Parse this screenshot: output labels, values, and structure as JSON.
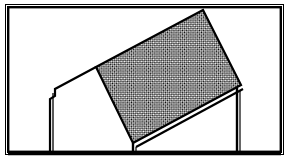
{
  "figure": {
    "type": "technical-line-drawing",
    "caption": "",
    "canvas": {
      "width": 289,
      "height": 167,
      "background": "#ffffff"
    },
    "colors": {
      "line": "#000000",
      "background": "#ffffff",
      "hatch": "#000000",
      "frame_outer": "#ffffff",
      "frame_inner": "#000000"
    },
    "frame": {
      "outer_rect": {
        "x": 5,
        "y": 4,
        "width": 279,
        "height": 151
      },
      "inner_rect": {
        "x": 8,
        "y": 7,
        "width": 273,
        "height": 145
      },
      "stroke_outer": 1,
      "stroke_inner": 2.4
    },
    "ground_line": {
      "x1": 8,
      "y1": 154,
      "x2": 281,
      "y2": 154,
      "stroke": 2.4
    },
    "hatched_panel": {
      "label": "tilted-roof-panel",
      "points": "96,67 203,10 241,85 133,143",
      "fill": "hatch-crosshatch",
      "stroke": 2.2,
      "corners": {
        "upper_left": [
          96,
          67
        ],
        "apex_top": [
          203,
          10
        ],
        "right": [
          241,
          85
        ],
        "bottom_left": [
          133,
          143
        ]
      }
    },
    "panel_underside": {
      "label": "roof-thickness-edge",
      "points": "136,147 243,89",
      "stroke": 2.2,
      "gap_px": 3
    },
    "left_roof_slope": {
      "label": "left-roof-slope-line",
      "points": "96,67 55,89",
      "stroke": 2.2
    },
    "left_eave_notch": {
      "label": "left-eave-step",
      "points": "55,89 55,96 50,99 50,154",
      "stroke": 2.2
    },
    "left_eave_under": {
      "label": "left-eave-underside",
      "points": "53,93 53,154",
      "stroke": 1.4
    },
    "right_wall": {
      "label": "right-wall-line",
      "points": "237,88 237,154",
      "stroke": 2.4
    },
    "right_wall_inner": {
      "label": "right-wall-inner-line",
      "points": "240,90 240,154",
      "stroke": 1.2
    },
    "bottom_post": {
      "label": "bottom-left-support-post",
      "points": "133,143 133,154",
      "stroke": 2.4
    },
    "bottom_post_inner": {
      "label": "bottom-left-support-post-inner",
      "points": "136,147 136,154",
      "stroke": 1.2
    },
    "hatch_pattern": {
      "type": "crosshatch-diagonal",
      "spacing_px": 3,
      "stroke_px": 1,
      "angle_deg": 45
    }
  }
}
